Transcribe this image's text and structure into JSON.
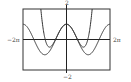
{
  "chart_data": {
    "type": "line",
    "title": "",
    "xlabel": "",
    "ylabel": "",
    "xlim": [
      -6.283185,
      6.283185
    ],
    "ylim": [
      -2,
      2
    ],
    "grid": false,
    "legend": null,
    "tick_labels": {
      "x_min": "−2π",
      "x_max": "2π",
      "y_max": "2",
      "y_min": "−2"
    },
    "series": [
      {
        "name": "f(x) = cos x",
        "expression": "cos(x)",
        "color": "#333333",
        "sample_points": [
          {
            "x": -6.283,
            "y": 1
          },
          {
            "x": -4.712,
            "y": 0
          },
          {
            "x": -3.142,
            "y": -1
          },
          {
            "x": -1.571,
            "y": 0
          },
          {
            "x": 0,
            "y": 1
          },
          {
            "x": 1.571,
            "y": 0
          },
          {
            "x": 3.142,
            "y": -1
          },
          {
            "x": 4.712,
            "y": 0
          },
          {
            "x": 6.283,
            "y": 1
          }
        ]
      },
      {
        "name": "P4(x) = 1 − x²/2 + x⁴/24",
        "expression": "1 - x^2/2 + x^4/24",
        "color": "#333333",
        "sample_points": [
          {
            "x": -3.71,
            "y": 2
          },
          {
            "x": -3,
            "y": 0.875
          },
          {
            "x": -2.449,
            "y": -0.5
          },
          {
            "x": -1.5,
            "y": 0.086
          },
          {
            "x": 0,
            "y": 1
          },
          {
            "x": 1.5,
            "y": 0.086
          },
          {
            "x": 2.449,
            "y": -0.5
          },
          {
            "x": 3,
            "y": 0.875
          },
          {
            "x": 3.71,
            "y": 2
          }
        ]
      }
    ]
  },
  "frame": {
    "left": 23,
    "top": 9,
    "right": 110,
    "bottom": 70
  },
  "axis_color": "#222222",
  "frame_color": "#333333"
}
